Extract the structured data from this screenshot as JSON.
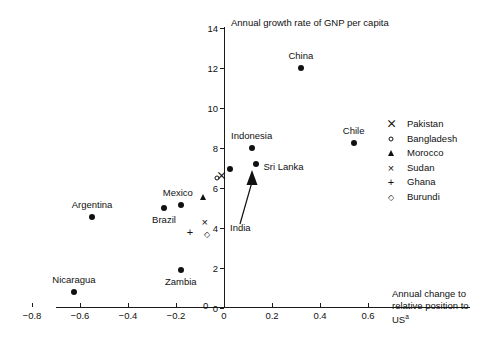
{
  "chart_data": {
    "type": "scatter",
    "title": "",
    "xlabel": "Annual change to relative position to US",
    "xlabel_sup": "a",
    "ylabel": "Annual growth rate of GNP per capita",
    "xlim": [
      -0.9,
      0.62
    ],
    "ylim": [
      0,
      14
    ],
    "grid": false,
    "legend_position": "right",
    "xticks": [
      -0.8,
      -0.6,
      -0.4,
      -0.2,
      0,
      0.2,
      0.4,
      0.6
    ],
    "xtick_labels": [
      "−0.8",
      "−0.6",
      "−0.4",
      "−0.2",
      "0",
      "0.2",
      "0.4",
      "0.6"
    ],
    "yticks": [
      0,
      2,
      4,
      6,
      8,
      10,
      12,
      14
    ],
    "ytick_labels": [
      "0",
      "2",
      "4",
      "6",
      "8",
      "10",
      "12",
      "14"
    ],
    "origin_label": "0",
    "points": [
      {
        "name": "China",
        "x": 0.32,
        "y": 12.0,
        "marker": "filled-circle",
        "label": "China",
        "label_dx": 0,
        "label_dy": -13,
        "label_align": "center"
      },
      {
        "name": "Chile",
        "x": 0.54,
        "y": 8.25,
        "marker": "filled-circle",
        "label": "Chile",
        "label_dx": 0,
        "label_dy": -13,
        "label_align": "center"
      },
      {
        "name": "Indonesia",
        "x": 0.115,
        "y": 8.0,
        "marker": "filled-circle",
        "label": "Indonesia",
        "label_dx": 0,
        "label_dy": -13,
        "label_align": "center"
      },
      {
        "name": "Sri Lanka",
        "x": 0.135,
        "y": 7.2,
        "marker": "filled-circle",
        "label": "Sri Lanka",
        "label_dx": 7,
        "label_dy": 2,
        "label_align": "left"
      },
      {
        "name": "India",
        "x": 0.027,
        "y": 6.95,
        "marker": "filled-circle",
        "label": "",
        "label_dx": 0,
        "label_dy": 0,
        "label_align": "center"
      },
      {
        "name": "Pakistan",
        "x": -0.01,
        "y": 6.6,
        "marker": "bowtie",
        "label": "",
        "label_dx": 0,
        "label_dy": 0,
        "label_align": "center"
      },
      {
        "name": "Bangladesh",
        "x": -0.03,
        "y": 6.5,
        "marker": "open-circle",
        "label": "",
        "label_dx": 0,
        "label_dy": 0,
        "label_align": "center"
      },
      {
        "name": "Morocco",
        "x": -0.088,
        "y": 5.55,
        "marker": "triangle",
        "label": "",
        "label_dx": 0,
        "label_dy": 0,
        "label_align": "center"
      },
      {
        "name": "Mexico",
        "x": -0.18,
        "y": 5.15,
        "marker": "filled-circle",
        "label": "Mexico",
        "label_dx": -3,
        "label_dy": -13,
        "label_align": "center"
      },
      {
        "name": "Brazil",
        "x": -0.25,
        "y": 5.0,
        "marker": "filled-circle",
        "label": "Brazil",
        "label_dx": 0,
        "label_dy": 11,
        "label_align": "center"
      },
      {
        "name": "Argentina",
        "x": -0.55,
        "y": 4.55,
        "marker": "filled-circle",
        "label": "Argentina",
        "label_dx": 0,
        "label_dy": -13,
        "label_align": "center"
      },
      {
        "name": "Sudan",
        "x": -0.08,
        "y": 4.3,
        "marker": "cross-x",
        "label": "",
        "label_dx": 0,
        "label_dy": 0,
        "label_align": "center"
      },
      {
        "name": "Ghana",
        "x": -0.142,
        "y": 3.8,
        "marker": "plus",
        "label": "",
        "label_dx": 0,
        "label_dy": 0,
        "label_align": "center"
      },
      {
        "name": "Burundi",
        "x": -0.072,
        "y": 3.7,
        "marker": "diamond",
        "label": "",
        "label_dx": 0,
        "label_dy": 0,
        "label_align": "center"
      },
      {
        "name": "Zambia",
        "x": -0.18,
        "y": 1.9,
        "marker": "filled-circle",
        "label": "Zambia",
        "label_dx": 0,
        "label_dy": 11,
        "label_align": "center"
      },
      {
        "name": "Nicaragua",
        "x": -0.625,
        "y": 0.8,
        "marker": "filled-circle",
        "label": "Nicaragua",
        "label_dx": 0,
        "label_dy": -13,
        "label_align": "center"
      }
    ],
    "annotations": [
      {
        "text": "India",
        "target": "India",
        "style": "arrow-callout"
      }
    ],
    "legend": [
      {
        "label": "Pakistan",
        "marker": "bowtie",
        "glyph": "⊓"
      },
      {
        "label": "Bangladesh",
        "marker": "open-circle",
        "glyph": "○"
      },
      {
        "label": "Morocco",
        "marker": "triangle",
        "glyph": "△"
      },
      {
        "label": "Sudan",
        "marker": "cross-x",
        "glyph": "×"
      },
      {
        "label": "Ghana",
        "marker": "plus",
        "glyph": "+"
      },
      {
        "label": "Burundi",
        "marker": "diamond",
        "glyph": "◇"
      }
    ]
  },
  "annotation_labels": {
    "india": "India"
  },
  "caption": {
    "partial_line": ""
  }
}
